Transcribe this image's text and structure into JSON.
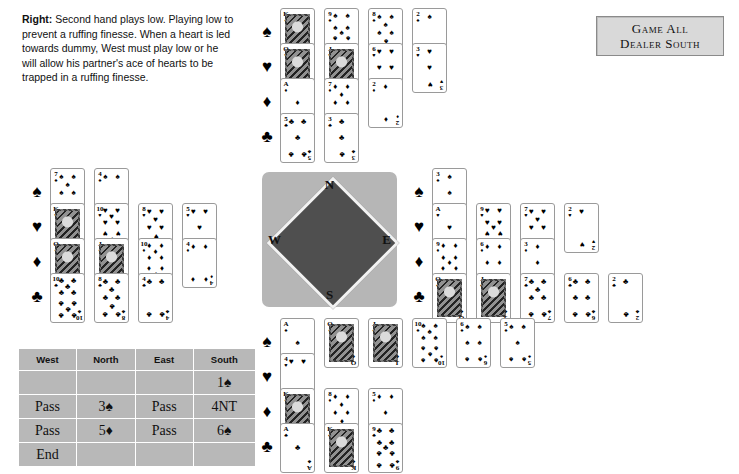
{
  "caption": {
    "lead": "Right:",
    "text": " Second hand plays low. Playing low to prevent a ruffing finesse. When a heart is led towards dummy, West must play low or he will allow his partner's ace of hearts to be trapped in a ruffing finesse."
  },
  "vulnerability": {
    "line1": "Game All",
    "line2": "Dealer South"
  },
  "compass": {
    "north": "N",
    "south": "S",
    "west": "W",
    "east": "E"
  },
  "suits": {
    "spade": "♠",
    "heart": "♥",
    "diamond": "♦",
    "club": "♣"
  },
  "hands": {
    "north": {
      "label": "North",
      "spades": [
        "K",
        "9",
        "8",
        "2"
      ],
      "hearts": [
        "Q",
        "J",
        "6",
        "3"
      ],
      "diamonds": [
        "A",
        "7",
        "2"
      ],
      "clubs": [
        "5",
        "3"
      ]
    },
    "west": {
      "label": "West",
      "spades": [
        "7",
        "4"
      ],
      "hearts": [
        "K",
        "10",
        "8",
        "5"
      ],
      "diamonds": [
        "Q",
        "J",
        "10",
        "4"
      ],
      "clubs": [
        "10",
        "8",
        "4"
      ]
    },
    "east": {
      "label": "East",
      "spades": [
        "3"
      ],
      "hearts": [
        "A",
        "9",
        "7",
        "2"
      ],
      "diamonds": [
        "9",
        "6",
        "3"
      ],
      "clubs": [
        "Q",
        "J",
        "7",
        "6",
        "2"
      ]
    },
    "south": {
      "label": "South",
      "spades": [
        "A",
        "Q",
        "J",
        "10",
        "6",
        "5"
      ],
      "hearts": [
        "4"
      ],
      "diamonds": [
        "K",
        "8",
        "5"
      ],
      "clubs": [
        "A",
        "K",
        "9"
      ]
    }
  },
  "bidding": {
    "headers": [
      "West",
      "North",
      "East",
      "South"
    ],
    "rows": [
      [
        "",
        "",
        "",
        "1♠"
      ],
      [
        "Pass",
        "3♠",
        "Pass",
        "4NT"
      ],
      [
        "Pass",
        "5♦",
        "Pass",
        "6♠"
      ],
      [
        "End",
        "",
        "",
        ""
      ]
    ]
  },
  "colors": {
    "page_background": "#ffffff",
    "panel_gray": "#b8b8b8",
    "compass_background": "#b6b6b6",
    "compass_diamond": "#4f4f4f",
    "vulbox_background": "#d9d9d9",
    "ink": "#000000"
  }
}
